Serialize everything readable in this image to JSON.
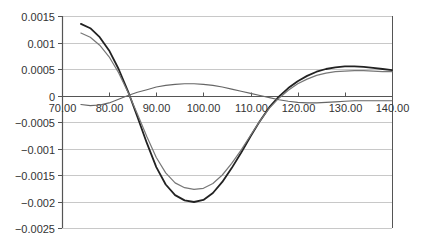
{
  "chart_data": {
    "type": "line",
    "title": "",
    "xlabel": "",
    "ylabel": "",
    "xlim": [
      70,
      140
    ],
    "ylim": [
      -0.0025,
      0.0015
    ],
    "grid": true,
    "legend": "none",
    "x_ticks": [
      "70.00",
      "80.00",
      "90.00",
      "100.00",
      "110.00",
      "120.00",
      "130.00",
      "140.00"
    ],
    "y_ticks": [
      "0.0015",
      "0.001",
      "0.0005",
      "0",
      "-0.0005",
      "-0.001",
      "-0.0015",
      "-0.002",
      "-0.0025"
    ],
    "x": [
      74,
      76,
      78,
      80,
      82,
      84,
      86,
      88,
      90,
      92,
      94,
      96,
      98,
      100,
      102,
      104,
      106,
      108,
      110,
      112,
      114,
      116,
      118,
      120,
      122,
      124,
      126,
      128,
      130,
      132,
      134,
      136,
      138,
      140
    ],
    "series": [
      {
        "name": "Series 1 (black)",
        "color": "#222222",
        "values": [
          0.00135,
          0.00127,
          0.0011,
          0.00085,
          0.0005,
          8e-05,
          -0.0004,
          -0.0009,
          -0.00135,
          -0.00168,
          -0.00188,
          -0.00198,
          -0.00201,
          -0.00197,
          -0.00184,
          -0.00163,
          -0.00137,
          -0.00108,
          -0.00077,
          -0.00048,
          -0.00022,
          -2e-05,
          0.00014,
          0.00027,
          0.00037,
          0.00045,
          0.0005,
          0.00053,
          0.00055,
          0.00055,
          0.00054,
          0.00052,
          0.0005,
          0.00048
        ]
      },
      {
        "name": "Series 2 (gray)",
        "color": "#777777",
        "values": [
          0.00118,
          0.0011,
          0.00095,
          0.00073,
          0.00043,
          6e-05,
          -0.00035,
          -0.00078,
          -0.00117,
          -0.00146,
          -0.00165,
          -0.00174,
          -0.00177,
          -0.00175,
          -0.00166,
          -0.0015,
          -0.00128,
          -0.00103,
          -0.00075,
          -0.00048,
          -0.00024,
          -5e-05,
          0.0001,
          0.00022,
          0.00031,
          0.00038,
          0.00042,
          0.00045,
          0.00046,
          0.00047,
          0.00047,
          0.00046,
          0.00045,
          0.00045
        ]
      },
      {
        "name": "Series 3 (difference)",
        "color": "#666666",
        "values": [
          -0.00017,
          -0.00019,
          -0.00018,
          -0.00014,
          -7e-05,
          0.0,
          6e-05,
          0.00011,
          0.00016,
          0.00019,
          0.00021,
          0.00022,
          0.00022,
          0.00021,
          0.00019,
          0.00016,
          0.00012,
          8e-05,
          4e-05,
          0.0,
          -4e-05,
          -8e-05,
          -0.00011,
          -0.00013,
          -0.00014,
          -0.00014,
          -0.00013,
          -0.00012,
          -0.00011,
          -0.0001,
          -0.0001,
          -0.0001,
          -0.0001,
          -0.0001
        ]
      }
    ]
  },
  "plot_area": {
    "left": 62,
    "right": 392,
    "top": 16,
    "bottom": 228
  },
  "colors": {
    "gridline": "#c8c8c8",
    "axis": "#555555",
    "text": "#333333"
  }
}
